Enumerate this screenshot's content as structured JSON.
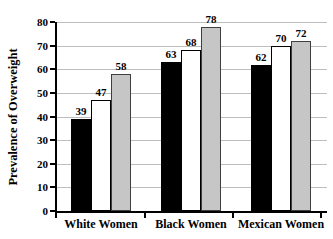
{
  "figure": {
    "background_color": "#ffffff",
    "axis_color": "#000000"
  },
  "chart_data": {
    "type": "bar",
    "title": "",
    "ylabel": "Prevalence of Overweight",
    "xlabel": "",
    "categories": [
      "White Women",
      "Black Women",
      "Mexican Women"
    ],
    "series": [
      {
        "name": "black-bar",
        "fill": "#000000",
        "border": "#000000",
        "values": [
          39,
          63,
          62
        ]
      },
      {
        "name": "white-bar",
        "fill": "#ffffff",
        "border": "#000000",
        "values": [
          47,
          68,
          70
        ]
      },
      {
        "name": "gray-bar",
        "fill": "#c6c6c6",
        "border": "#3f3f3f",
        "values": [
          58,
          78,
          72
        ]
      }
    ],
    "ylim": [
      0,
      80
    ],
    "yticks": [
      "0",
      "10",
      "20",
      "30",
      "40",
      "50",
      "60",
      "70",
      "80"
    ],
    "grid": "horizontal",
    "gridline_color": "#bdbdbd",
    "legend": "none",
    "bar_value_labels": true
  }
}
